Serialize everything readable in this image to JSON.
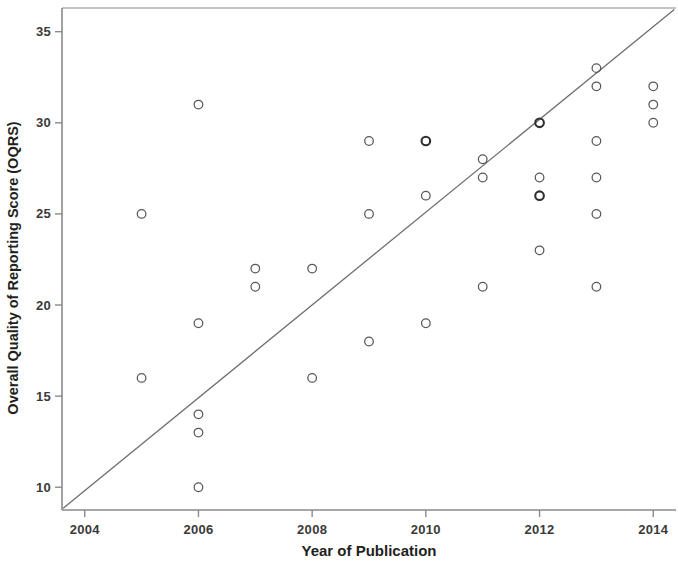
{
  "chart_data": {
    "type": "scatter",
    "title": "",
    "xlabel": "Year of Publication",
    "ylabel": "Overall Quality of Reporting Score (OQRS)",
    "xlim": [
      2003.6,
      2014.4
    ],
    "ylim": [
      8.75,
      36.3
    ],
    "xticks": [
      2004,
      2006,
      2008,
      2010,
      2012,
      2014
    ],
    "xtick_labels": [
      "2004",
      "2006",
      "2008",
      "2010",
      "2012",
      "2014"
    ],
    "yticks": [
      10,
      15,
      20,
      25,
      30,
      35
    ],
    "ytick_labels": [
      "10",
      "15",
      "20",
      "25",
      "30",
      "35"
    ],
    "grid": false,
    "legend": null,
    "marker": "open-circle",
    "points": [
      {
        "x": 2005,
        "y": 25,
        "emphasis": false
      },
      {
        "x": 2005,
        "y": 16,
        "emphasis": false
      },
      {
        "x": 2006,
        "y": 31,
        "emphasis": false
      },
      {
        "x": 2006,
        "y": 19,
        "emphasis": false
      },
      {
        "x": 2006,
        "y": 14,
        "emphasis": false
      },
      {
        "x": 2006,
        "y": 13,
        "emphasis": false
      },
      {
        "x": 2006,
        "y": 10,
        "emphasis": false
      },
      {
        "x": 2007,
        "y": 22,
        "emphasis": false
      },
      {
        "x": 2007,
        "y": 21,
        "emphasis": false
      },
      {
        "x": 2008,
        "y": 22,
        "emphasis": false
      },
      {
        "x": 2008,
        "y": 16,
        "emphasis": false
      },
      {
        "x": 2009,
        "y": 29,
        "emphasis": false
      },
      {
        "x": 2009,
        "y": 25,
        "emphasis": false
      },
      {
        "x": 2009,
        "y": 18,
        "emphasis": false
      },
      {
        "x": 2010,
        "y": 29,
        "emphasis": true
      },
      {
        "x": 2010,
        "y": 26,
        "emphasis": false
      },
      {
        "x": 2010,
        "y": 19,
        "emphasis": false
      },
      {
        "x": 2011,
        "y": 28,
        "emphasis": false
      },
      {
        "x": 2011,
        "y": 27,
        "emphasis": false
      },
      {
        "x": 2011,
        "y": 21,
        "emphasis": false
      },
      {
        "x": 2012,
        "y": 30,
        "emphasis": true
      },
      {
        "x": 2012,
        "y": 27,
        "emphasis": false
      },
      {
        "x": 2012,
        "y": 26,
        "emphasis": true
      },
      {
        "x": 2012,
        "y": 23,
        "emphasis": false
      },
      {
        "x": 2013,
        "y": 33,
        "emphasis": false
      },
      {
        "x": 2013,
        "y": 32,
        "emphasis": false
      },
      {
        "x": 2013,
        "y": 29,
        "emphasis": false
      },
      {
        "x": 2013,
        "y": 27,
        "emphasis": false
      },
      {
        "x": 2013,
        "y": 25,
        "emphasis": false
      },
      {
        "x": 2013,
        "y": 21,
        "emphasis": false
      },
      {
        "x": 2014,
        "y": 32,
        "emphasis": false
      },
      {
        "x": 2014,
        "y": 31,
        "emphasis": false
      },
      {
        "x": 2014,
        "y": 30,
        "emphasis": false
      }
    ],
    "reference_line": {
      "label": "",
      "x_start": 2003.62,
      "y_start": 8.85,
      "x_end": 2014.37,
      "y_end": 36.22
    },
    "colors": {
      "marker_stroke": "#585858",
      "marker_stroke_emphasis": "#2e2e2e",
      "line": "#6e6e6e",
      "axis": "#8a8a8a",
      "text": "#231f20",
      "background": "#ffffff"
    }
  }
}
